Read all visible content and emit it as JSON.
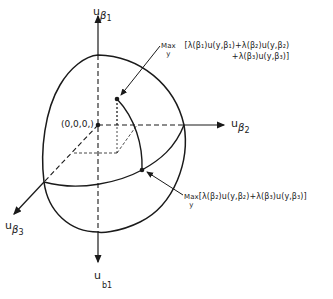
{
  "figure": {
    "type": "3D utility possibility surface diagram",
    "axes": {
      "vertical_up": {
        "base": "u",
        "sub": "β",
        "subsub": "1"
      },
      "horizontal_right": {
        "base": "u",
        "sub": "β",
        "subsub": "2"
      },
      "diagonal_down_left": {
        "base": "u",
        "sub": "β",
        "subsub": "3"
      },
      "vertical_down": {
        "base": "u",
        "sub": "b1"
      }
    },
    "origin_label": "(0,0,0,)",
    "annotation_top": {
      "max": "Max",
      "var": "y",
      "line1": "[λ(β₁)u(y,β₁)+λ(β₂)u(y,β₂)",
      "line2": "+λ(β₃)u(y,β₃)]"
    },
    "annotation_bottom": {
      "max": "Max",
      "var": "y",
      "line1": "[λ(β₂)u(y,β₂)+λ(β₃)u(y,β₃)]"
    },
    "colors": {
      "ink": "#1a1a1a",
      "background": "#ffffff"
    }
  }
}
